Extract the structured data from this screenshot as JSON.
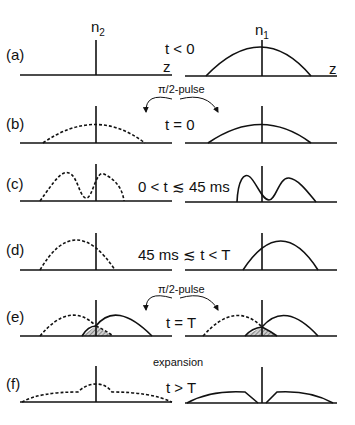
{
  "figure": {
    "column_headers": {
      "left": "n",
      "left_sub": "2",
      "right": "n",
      "right_sub": "1"
    },
    "axis_label": "z",
    "rows": [
      {
        "id": "a",
        "panel_label": "(a)",
        "time_label": "t < 0",
        "pulse_label": ""
      },
      {
        "id": "b",
        "panel_label": "(b)",
        "time_label": "t = 0",
        "pulse_label": "π/2-pulse"
      },
      {
        "id": "c",
        "panel_label": "(c)",
        "time_label": "0 < t ≲ 45 ms",
        "pulse_label": ""
      },
      {
        "id": "d",
        "panel_label": "(d)",
        "time_label": "45 ms ≲ t < T",
        "pulse_label": ""
      },
      {
        "id": "e",
        "panel_label": "(e)",
        "time_label": "t = T",
        "pulse_label": "π/2-pulse"
      },
      {
        "id": "f",
        "panel_label": "(f)",
        "time_label": "t > T",
        "pulse_label": "expansion"
      }
    ],
    "line_styles": {
      "n2": "dashed",
      "n1": "solid"
    },
    "colors": {
      "ink": "#111111",
      "background": "#ffffff",
      "hatch": "#555555"
    }
  }
}
